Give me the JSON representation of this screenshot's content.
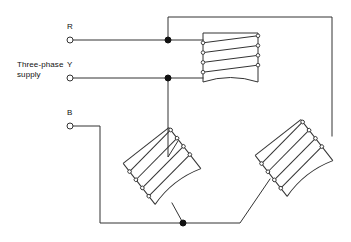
{
  "diagram": {
    "background_color": "#ffffff",
    "line_color": "#333333",
    "node_color": "#111111",
    "width": 351,
    "height": 242
  },
  "labels": {
    "supply": "Three-phase\nsupply",
    "phase_r": "R",
    "phase_y": "Y",
    "phase_b": "B"
  },
  "terminals": [
    {
      "name": "R",
      "x": 70,
      "y": 40,
      "radius": 3
    },
    {
      "name": "Y",
      "x": 70,
      "y": 78,
      "radius": 3
    },
    {
      "name": "B",
      "x": 70,
      "y": 126,
      "radius": 3
    }
  ],
  "junctions": [
    {
      "name": "r-junction",
      "x": 168,
      "y": 40,
      "radius": 3
    },
    {
      "name": "y-junction",
      "x": 168,
      "y": 78,
      "radius": 3
    },
    {
      "name": "b-junction",
      "x": 183,
      "y": 223,
      "radius": 3
    }
  ],
  "coils": [
    {
      "name": "coil-top",
      "position": "top-right",
      "rotation_deg": 0,
      "turns": 4,
      "x": 203,
      "y": 33,
      "w": 55,
      "h": 49
    },
    {
      "name": "coil-bottom-left",
      "position": "bottom-centre-left",
      "rotation_deg": -38,
      "turns": 4,
      "x": 133,
      "y": 140,
      "w": 58,
      "h": 52
    },
    {
      "name": "coil-bottom-right",
      "position": "bottom-right",
      "rotation_deg": -38,
      "turns": 4,
      "x": 265,
      "y": 132,
      "w": 58,
      "h": 52
    }
  ],
  "wires": [
    {
      "name": "wire-r-supply",
      "path": "M73,40 L203,40"
    },
    {
      "name": "wire-y-supply",
      "path": "M73,78 L203,78"
    },
    {
      "name": "wire-b-supply",
      "path": "M73,126 L100,126 L100,223 L183,223"
    },
    {
      "name": "wire-top-return",
      "path": "M168,40 L168,17 L332,17 L332,136"
    },
    {
      "name": "wire-y-to-coil2",
      "path": "M168,78 L168,157 L178,141"
    },
    {
      "name": "wire-coil2-bottom",
      "path": "M172,203 L183,223"
    },
    {
      "name": "wire-coil3-bottom",
      "path": "M183,223 L240,223 L270,179"
    }
  ]
}
